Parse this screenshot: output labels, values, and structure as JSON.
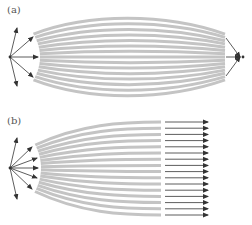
{
  "panels": [
    {
      "label": "(a)",
      "description": "Point source emits diverging rays; curved wavefront bands refract and converge to a focal point on the right"
    },
    {
      "label": "(b)",
      "description": "Point source emits diverging rays; curved wavefront bands refract into parallel collimated rays"
    }
  ],
  "colors": {
    "band": "#c4c4c4",
    "arrow": "#333333",
    "label": "#555555"
  },
  "counts": {
    "panel_a_bands": 15,
    "panel_a_source_arrows": 5,
    "panel_a_focus_arrows": 3,
    "panel_b_bands": 16,
    "panel_b_source_arrows": 7,
    "panel_b_output_arrows": 16
  }
}
